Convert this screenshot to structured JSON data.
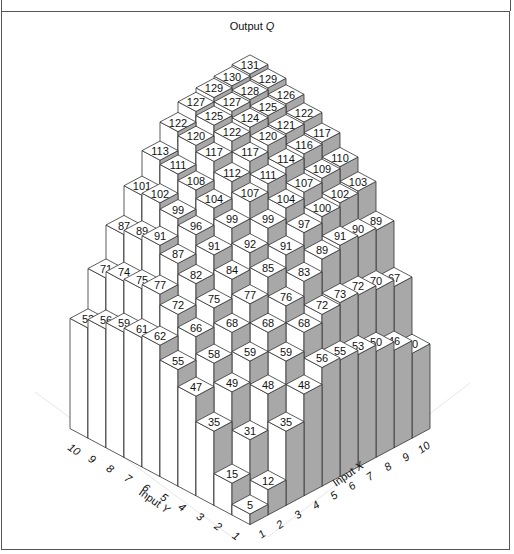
{
  "chart_data": {
    "type": "3d-bar",
    "title": "Output Q",
    "xlabel": "Input X",
    "ylabel": "Input Y",
    "x_ticks": [
      "1",
      "2",
      "3",
      "4",
      "5",
      "6",
      "7",
      "8",
      "9",
      "10"
    ],
    "y_ticks": [
      "1",
      "2",
      "3",
      "4",
      "5",
      "6",
      "7",
      "8",
      "9",
      "10"
    ],
    "grid_note": "values[Y-1][X-1]",
    "values": [
      [
        5,
        12,
        35,
        48,
        56,
        55,
        53,
        50,
        46,
        40
      ],
      [
        15,
        31,
        48,
        59,
        68,
        72,
        73,
        72,
        70,
        67
      ],
      [
        35,
        49,
        59,
        68,
        76,
        83,
        89,
        91,
        90,
        89
      ],
      [
        47,
        58,
        68,
        77,
        85,
        91,
        97,
        100,
        102,
        103
      ],
      [
        55,
        66,
        75,
        84,
        92,
        99,
        104,
        107,
        109,
        110
      ],
      [
        62,
        72,
        82,
        91,
        99,
        107,
        111,
        114,
        116,
        117
      ],
      [
        61,
        77,
        87,
        96,
        104,
        112,
        117,
        120,
        121,
        122
      ],
      [
        59,
        75,
        91,
        99,
        108,
        117,
        122,
        124,
        125,
        126
      ],
      [
        56,
        74,
        89,
        102,
        111,
        120,
        125,
        127,
        128,
        129
      ],
      [
        52,
        71,
        87,
        101,
        113,
        122,
        127,
        129,
        130,
        131
      ]
    ],
    "colors": {
      "top": "#ffffff",
      "left_face": "#ffffff",
      "right_face": "#a8a8a8",
      "edge": "#333333"
    }
  },
  "labels": {
    "title_main": "Output ",
    "title_var": "Q",
    "x_axis_main": "Input ",
    "x_axis_var": "X",
    "y_axis_main": "Input ",
    "y_axis_var": "Y"
  }
}
